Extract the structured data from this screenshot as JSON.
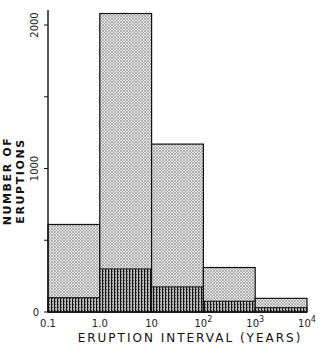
{
  "chart_data": {
    "type": "bar",
    "subtype": "stacked-histogram",
    "title": "",
    "xlabel": "ERUPTION INTERVAL (YEARS)",
    "ylabel": "NUMBER OF ERUPTIONS",
    "x_scale": "log",
    "x_tick_labels": [
      "0.1",
      "1.0",
      "10",
      "10^2",
      "10^3",
      "10^4"
    ],
    "y_tick_labels": [
      "0",
      "1000",
      "2000"
    ],
    "y_ticks": [
      0,
      500,
      1000,
      1500,
      2000
    ],
    "ylim": [
      0,
      2150
    ],
    "grid": false,
    "legend": null,
    "bins": [
      {
        "from": 0.1,
        "to": 1
      },
      {
        "from": 1,
        "to": 10
      },
      {
        "from": 10,
        "to": 100
      },
      {
        "from": 100,
        "to": 1000
      },
      {
        "from": 1000,
        "to": 10000
      }
    ],
    "categories": [
      "0.1-1.0",
      "1.0-10",
      "10-10^2",
      "10^2-10^3",
      "10^3-10^4"
    ],
    "series": [
      {
        "name": "total (stippled)",
        "values": [
          610,
          2080,
          1170,
          310,
          95
        ]
      },
      {
        "name": "subset (vertical hatched)",
        "values": [
          100,
          300,
          175,
          75,
          30
        ]
      }
    ]
  }
}
